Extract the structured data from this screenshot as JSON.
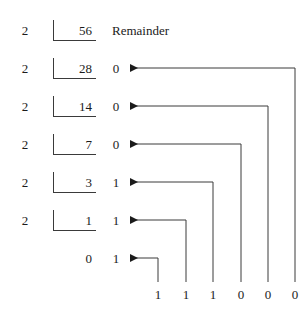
{
  "figure": {
    "title_fragment": "",
    "headers": {
      "remainder_label": "Remainder"
    },
    "colors": {
      "ink": "#1b1b1b",
      "line": "#3a3a3a",
      "background": "#ffffff"
    },
    "division_rows": [
      {
        "divisor": "2",
        "quotient": "56",
        "remainder": "",
        "has_bracket": true
      },
      {
        "divisor": "2",
        "quotient": "28",
        "remainder": "0",
        "has_bracket": true
      },
      {
        "divisor": "2",
        "quotient": "14",
        "remainder": "0",
        "has_bracket": true
      },
      {
        "divisor": "2",
        "quotient": "7",
        "remainder": "0",
        "has_bracket": true
      },
      {
        "divisor": "2",
        "quotient": "3",
        "remainder": "1",
        "has_bracket": true
      },
      {
        "divisor": "2",
        "quotient": "1",
        "remainder": "1",
        "has_bracket": true
      },
      {
        "divisor": "",
        "quotient": "0",
        "remainder": "1",
        "has_bracket": false
      }
    ],
    "result_bits": [
      "1",
      "1",
      "1",
      "0",
      "0",
      "0"
    ]
  }
}
